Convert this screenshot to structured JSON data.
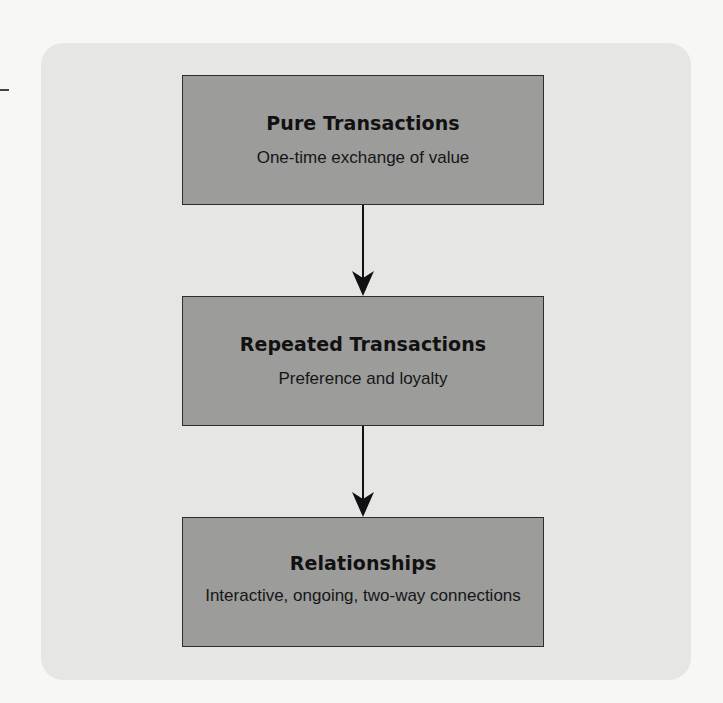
{
  "diagram": {
    "type": "vertical-flow",
    "colors": {
      "page_background": "#f7f7f5",
      "panel_background": "#e6e6e4",
      "box_fill": "#9c9c9b",
      "box_border": "#2e2e2e",
      "arrow": "#111111"
    },
    "nodes": [
      {
        "id": "pure",
        "title": "Pure Transactions",
        "description": "One-time exchange of value"
      },
      {
        "id": "repeated",
        "title": "Repeated Transactions",
        "description": "Preference and loyalty"
      },
      {
        "id": "relationships",
        "title": "Relationships",
        "description": "Interactive, ongoing, two-way connections"
      }
    ],
    "edges": [
      {
        "from": "pure",
        "to": "repeated",
        "icon": "arrow-down-icon"
      },
      {
        "from": "repeated",
        "to": "relationships",
        "icon": "arrow-down-icon"
      }
    ]
  }
}
